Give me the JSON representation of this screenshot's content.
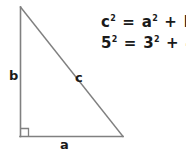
{
  "figure": {
    "type": "right-triangle-diagram",
    "background_color": "#ffffff",
    "stroke_color": "#808080",
    "text_color": "#1a1a1a",
    "vertices": {
      "apex": [
        20,
        7
      ],
      "right_angle_corner": [
        20,
        136
      ],
      "base_right": [
        123,
        136
      ]
    },
    "right_angle_marker": {
      "size": 8,
      "at": [
        20,
        136
      ]
    }
  },
  "labels": {
    "vertical_leg": "b",
    "hypotenuse": "c",
    "base_leg": "a"
  },
  "equations": [
    {
      "id": "pythagorean-general",
      "text": "c² = a² + b²",
      "terms": [
        {
          "base": "c",
          "exp": "2"
        },
        {
          "op": "="
        },
        {
          "base": "a",
          "exp": "2"
        },
        {
          "op": "+"
        },
        {
          "base": "b",
          "exp": "2"
        }
      ]
    },
    {
      "id": "pythagorean-345",
      "text": "5² = 3² + 4²",
      "terms": [
        {
          "base": "5",
          "exp": "2"
        },
        {
          "op": "="
        },
        {
          "base": "3",
          "exp": "2"
        },
        {
          "op": "+"
        },
        {
          "base": "4",
          "exp": "2"
        }
      ]
    }
  ]
}
